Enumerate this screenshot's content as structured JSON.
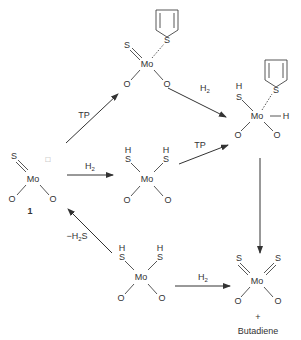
{
  "diagram": {
    "type": "reaction-scheme",
    "atoms": {
      "metal": "Mo",
      "sulfur": "S",
      "oxygen": "O",
      "hydrogen": "H"
    },
    "vacancy_symbol": "□",
    "compound_1_label": "1",
    "reagents": {
      "tp_top": "TP",
      "h2_top": "H",
      "h2_top_sub": "2",
      "h2_mid": "H",
      "h2_mid_sub": "2",
      "tp_mid": "TP",
      "minus_h2s": "−H",
      "minus_h2s_sub": "2",
      "minus_h2s_tail": "S",
      "h2_bottom": "H",
      "h2_bottom_sub": "2"
    },
    "product": {
      "plus": "+",
      "name": "Butadiene"
    },
    "colors": {
      "ink": "#333333",
      "background": "#ffffff"
    }
  }
}
